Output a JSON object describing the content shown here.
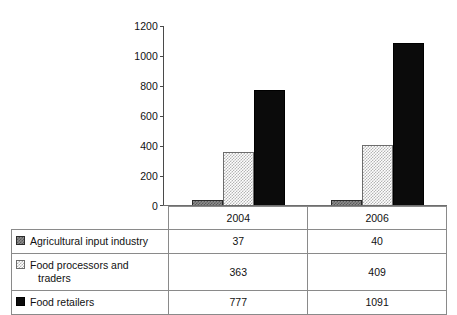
{
  "chart_data": {
    "type": "bar",
    "title": "",
    "subtitle": "",
    "xlabel": "",
    "ylabel": "",
    "categories": [
      "2004",
      "2006"
    ],
    "series": [
      {
        "name": "Agricultural input industry",
        "values": [
          37,
          40
        ],
        "pattern": "gray-checker",
        "color": "#8d8d8d"
      },
      {
        "name": "Food processors and traders",
        "values": [
          363,
          409
        ],
        "pattern": "light-checker",
        "color": "#e8e8e8"
      },
      {
        "name": "Food retailers",
        "values": [
          777,
          1091
        ],
        "pattern": "solid-black",
        "color": "#0b0b0b"
      }
    ],
    "ylim": [
      0,
      1200
    ],
    "yticks": [
      0,
      200,
      400,
      600,
      800,
      1000,
      1200
    ],
    "ytick_labels": [
      "0",
      "200",
      "400",
      "600",
      "800",
      "1000",
      "1200"
    ],
    "grid": false,
    "legend_position": "table-below",
    "annotations": []
  },
  "axis": {
    "y_labels": [
      "1200",
      "1000",
      "800",
      "600",
      "400",
      "200",
      "0"
    ]
  },
  "table": {
    "header": {
      "blank": "",
      "columns": [
        "2004",
        "2006"
      ]
    },
    "rows": [
      {
        "label": "Agricultural input industry",
        "label_line2": "",
        "swatch": "gray-checker-swatch",
        "values": [
          "37",
          "40"
        ]
      },
      {
        "label": "Food processors and",
        "label_line2": "traders",
        "swatch": "light-checker-swatch",
        "values": [
          "363",
          "409"
        ]
      },
      {
        "label": "Food retailers",
        "label_line2": "",
        "swatch": "solid-black-swatch",
        "values": [
          "777",
          "1091"
        ]
      }
    ]
  },
  "clipped_top_text": ""
}
